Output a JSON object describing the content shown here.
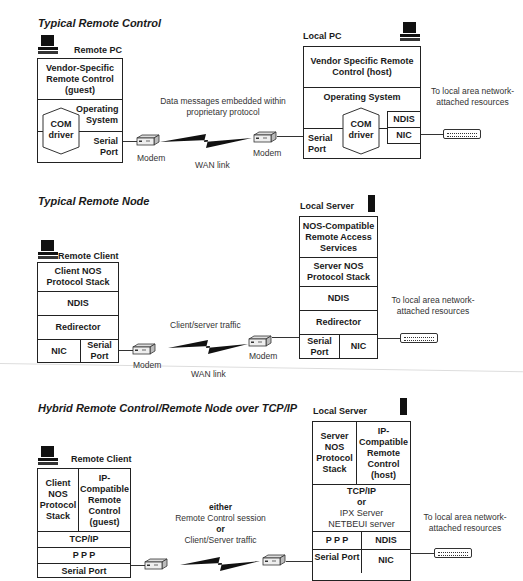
{
  "sections": [
    {
      "title": "Typical Remote Control",
      "remote": {
        "label": "Remote PC",
        "layers": [
          "Vendor-Specific Remote Control (guest)",
          "Operating System",
          "Serial Port"
        ],
        "com_driver": "COM driver"
      },
      "link": {
        "caption": "Data messages embedded within proprietary protocol",
        "modem_left": "Modem",
        "modem_right": "Modem",
        "wan": "WAN link"
      },
      "local": {
        "label": "Local PC",
        "layers": [
          "Vendor Specific Remote Control (host)",
          "Operating System",
          "Serial Port",
          "NDIS",
          "NIC"
        ],
        "com_driver": "COM driver"
      },
      "lan_caption": "To local area network-attached resources"
    },
    {
      "title": "Typical Remote Node",
      "remote": {
        "label": "Remote Client",
        "layers": [
          "Client NOS Protocol Stack",
          "NDIS",
          "Redirector",
          "NIC",
          "Serial Port"
        ]
      },
      "link": {
        "caption": "Client/server traffic",
        "modem_left": "Modem",
        "modem_right": "Modem",
        "wan": "WAN link"
      },
      "local": {
        "label": "Local Server",
        "layers": [
          "NOS-Compatible Remote Access Services",
          "Server NOS Protocol Stack",
          "NDIS",
          "Redirector",
          "Serial Port",
          "NIC"
        ]
      },
      "lan_caption": "To local area network-attached resources"
    },
    {
      "title": "Hybrid Remote Control/Remote Node over TCP/IP",
      "remote": {
        "label": "Remote Client",
        "layers": [
          "Client NOS Protocol Stack",
          "IP-Compatible Remote Control (guest)",
          "TCP/IP",
          "P P P",
          "Serial Port"
        ]
      },
      "link": {
        "caption_either": "either",
        "caption_a": "Remote Control session",
        "caption_or": "or",
        "caption_b": "Client/Server traffic"
      },
      "local": {
        "label": "Local Server",
        "layers": [
          "Server NOS Protocol Stack",
          "IP-Compatible Remote Control (host)",
          "TCP/IP",
          "or",
          "IPX Server",
          "NETBEUI server",
          "P P P",
          "NDIS",
          "Serial Port",
          "NIC"
        ]
      },
      "lan_caption": "To local area network-attached resources"
    }
  ]
}
